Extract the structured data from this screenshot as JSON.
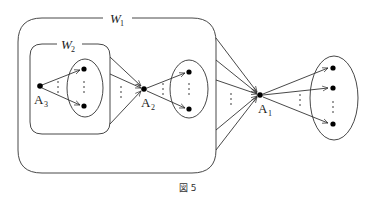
{
  "diagram": {
    "caption": "図 5",
    "regions": [
      {
        "id": "W1",
        "label": "W",
        "subscript": "1"
      },
      {
        "id": "W2",
        "label": "W",
        "subscript": "2"
      }
    ],
    "nodes": [
      {
        "id": "A3",
        "label": "A",
        "subscript": "3"
      },
      {
        "id": "A2",
        "label": "A",
        "subscript": "2"
      },
      {
        "id": "A1",
        "label": "A",
        "subscript": "1"
      }
    ],
    "sets": [
      {
        "id": "set-A3-targets",
        "visible_points": 2
      },
      {
        "id": "set-A2-targets",
        "visible_points": 2
      },
      {
        "id": "set-A1-targets",
        "visible_points": 3
      }
    ],
    "edges": [
      {
        "from": "A3",
        "to": "set-A3-targets",
        "arrows": 2,
        "ellipsis": "⋮"
      },
      {
        "from": "W2",
        "to": "A2",
        "arrows": 3,
        "ellipsis": "⋮"
      },
      {
        "from": "A2",
        "to": "set-A2-targets",
        "arrows": 2,
        "ellipsis": "⋮"
      },
      {
        "from": "W1",
        "to": "A1",
        "arrows": 6,
        "ellipsis": "⋮"
      },
      {
        "from": "A1",
        "to": "set-A1-targets",
        "arrows": 3,
        "ellipsis": "⋮"
      }
    ]
  }
}
